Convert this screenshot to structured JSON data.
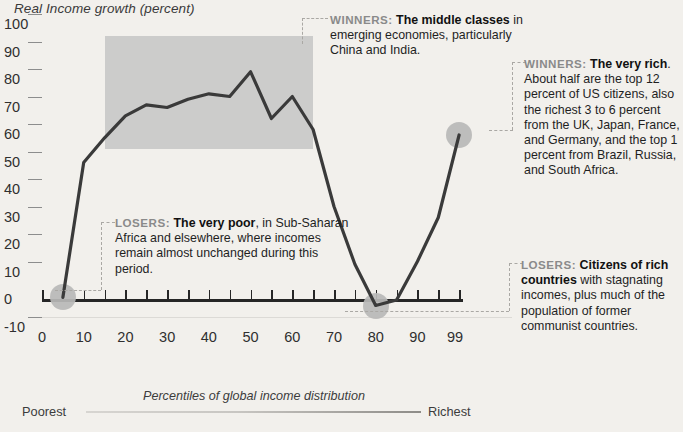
{
  "chart_data": {
    "type": "line",
    "title": "Real Income growth (percent)",
    "xlabel": "Percentiles of global income distribution",
    "ylabel": "Real Income growth (percent)",
    "xlim": [
      0,
      105
    ],
    "ylim": [
      -10,
      100
    ],
    "grid": true,
    "legend": "none",
    "x_tick_labels": [
      "0",
      "10",
      "20",
      "30",
      "40",
      "50",
      "60",
      "70",
      "80",
      "90",
      "99"
    ],
    "x_tick_values": [
      0,
      10,
      20,
      30,
      40,
      50,
      60,
      70,
      80,
      90,
      99
    ],
    "y_tick_labels": [
      "-10",
      "0",
      "10",
      "20",
      "30",
      "40",
      "50",
      "60",
      "70",
      "80",
      "90",
      "100"
    ],
    "y_tick_values": [
      -10,
      0,
      10,
      20,
      30,
      40,
      50,
      60,
      70,
      80,
      90,
      100
    ],
    "series": [
      {
        "name": "Real income growth by global income percentile, 1988-2008",
        "x": [
          5,
          10,
          15,
          20,
          25,
          30,
          35,
          40,
          45,
          50,
          55,
          60,
          65,
          70,
          75,
          80,
          85,
          90,
          95,
          100
        ],
        "values": [
          1,
          50,
          59,
          67,
          71,
          70,
          73,
          75,
          74,
          83,
          66,
          74,
          62,
          34,
          13,
          -2,
          0,
          14,
          30,
          60
        ]
      }
    ],
    "highlight_box": {
      "x_start": 15,
      "x_end": 65,
      "y_bottom": 55,
      "y_top": 96,
      "color": "#c9c9c9"
    },
    "markers": [
      {
        "x": 5,
        "y": 1,
        "label": "very-poor"
      },
      {
        "x": 80,
        "y": -2,
        "label": "citizens-of-rich-countries"
      },
      {
        "x": 100,
        "y": 60,
        "label": "very-rich"
      }
    ]
  },
  "footer": {
    "caption": "Percentiles of global income distribution",
    "left_label": "Poorest",
    "right_label": "Richest"
  },
  "annotations": {
    "winners_middle": {
      "lead": "WINNERS:",
      "bold": "The middle classes",
      "rest": " in emerging economies, particularly China and India."
    },
    "winners_rich": {
      "lead": "WINNERS:",
      "bold": "The very rich",
      "rest": ". About half are the top 12 percent of US citizens, also the richest 3 to 6 percent from the UK, Japan, France, and Germany, and the top 1 percent from Brazil, Russia, and South Africa."
    },
    "losers_poor": {
      "lead": "LOSERS:",
      "bold": "The very poor",
      "rest": ", in Sub-Saharan Africa and elsewhere, where incomes remain almost unchanged during this period."
    },
    "losers_rich_countries": {
      "lead": "LOSERS:",
      "bold": "Citizens of rich countries",
      "rest": " with stagnating incomes, plus much of the population of former communist countries."
    }
  },
  "colors": {
    "background": "#f2f0ec",
    "line": "#3a3a3a",
    "highlight": "#c9c9c9",
    "marker": "#b9b9b7",
    "axis": "#262626",
    "grid": "#dcdad6"
  }
}
